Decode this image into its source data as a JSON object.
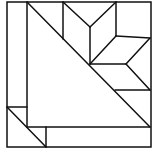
{
  "diagram": {
    "title": "",
    "type": "quilt-block",
    "stroke_color": "#111111",
    "background": "#ffffff",
    "outer_square": {
      "x1": 7,
      "y1": 2,
      "x2": 151,
      "y2": 147
    },
    "lines": [
      {
        "name": "left-strip-divider",
        "x1": 27,
        "y1": 2,
        "x2": 27,
        "y2": 127
      },
      {
        "name": "main-diagonal",
        "x1": 27,
        "y1": 2,
        "x2": 150,
        "y2": 127
      },
      {
        "name": "bottom-strip-divider",
        "x1": 27,
        "y1": 127,
        "x2": 150,
        "y2": 127
      },
      {
        "name": "corner-horizontal",
        "x1": 7,
        "y1": 107,
        "x2": 27,
        "y2": 107
      },
      {
        "name": "corner-diagonal",
        "x1": 7,
        "y1": 107,
        "x2": 46,
        "y2": 147
      },
      {
        "name": "corner-vertical",
        "x1": 46,
        "y1": 127,
        "x2": 46,
        "y2": 147
      },
      {
        "name": "star-left-vertical",
        "x1": 63,
        "y1": 2,
        "x2": 63,
        "y2": 39
      },
      {
        "name": "star-diamond1-a",
        "x1": 63,
        "y1": 2,
        "x2": 90,
        "y2": 27
      },
      {
        "name": "star-diamond1-b",
        "x1": 90,
        "y1": 27,
        "x2": 116,
        "y2": 2
      },
      {
        "name": "star-center-vertical",
        "x1": 90,
        "y1": 27,
        "x2": 90,
        "y2": 64
      },
      {
        "name": "star-diamond2-a",
        "x1": 116,
        "y1": 2,
        "x2": 116,
        "y2": 36
      },
      {
        "name": "star-diamond2-b",
        "x1": 116,
        "y1": 36,
        "x2": 90,
        "y2": 64
      },
      {
        "name": "star-horizontal-upper",
        "x1": 116,
        "y1": 36,
        "x2": 150,
        "y2": 38
      },
      {
        "name": "star-diamond3-a",
        "x1": 150,
        "y1": 38,
        "x2": 126,
        "y2": 64
      },
      {
        "name": "star-center-horizontal",
        "x1": 90,
        "y1": 64,
        "x2": 126,
        "y2": 64
      },
      {
        "name": "star-diamond4-a",
        "x1": 126,
        "y1": 64,
        "x2": 150,
        "y2": 90
      },
      {
        "name": "star-horizontal-lower",
        "x1": 115,
        "y1": 90,
        "x2": 150,
        "y2": 90
      }
    ]
  }
}
